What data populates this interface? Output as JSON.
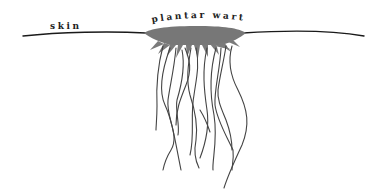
{
  "diagram": {
    "labels": {
      "skin": "skin",
      "wart": "plantar wart"
    },
    "colors": {
      "background": "#ffffff",
      "skin_line": "#1a1a1a",
      "wart_fill": "#777777",
      "roots": "#444444",
      "text": "#222222"
    },
    "elements": [
      "skin surface line",
      "plantar wart lesion",
      "root filaments"
    ]
  }
}
